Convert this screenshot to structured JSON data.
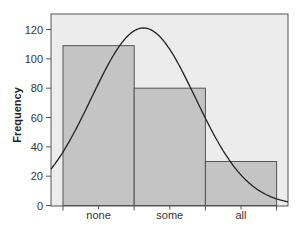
{
  "chart_data": {
    "type": "bar",
    "title": "",
    "xlabel": "",
    "ylabel": "Frequency",
    "categories": [
      "none",
      "some",
      "all"
    ],
    "values": [
      109,
      80,
      30
    ],
    "ylim": [
      0,
      125
    ],
    "yticks": [
      0,
      20,
      40,
      60,
      80,
      100,
      120
    ],
    "grid": false,
    "legend": null,
    "overlay": {
      "type": "normal-density-curve",
      "description": "Normal curve overlaid on the histogram",
      "peak_value": 121,
      "mean_category_position": 1.63,
      "sd_category_units": 0.73,
      "value_at_left_edge": 22,
      "value_at_right_edge": 2
    },
    "colors": {
      "plot_background": "#ececec",
      "bar_fill": "#c4c4c4",
      "bar_edge": "#555555",
      "curve": "#222222",
      "axis": "#555555"
    }
  }
}
